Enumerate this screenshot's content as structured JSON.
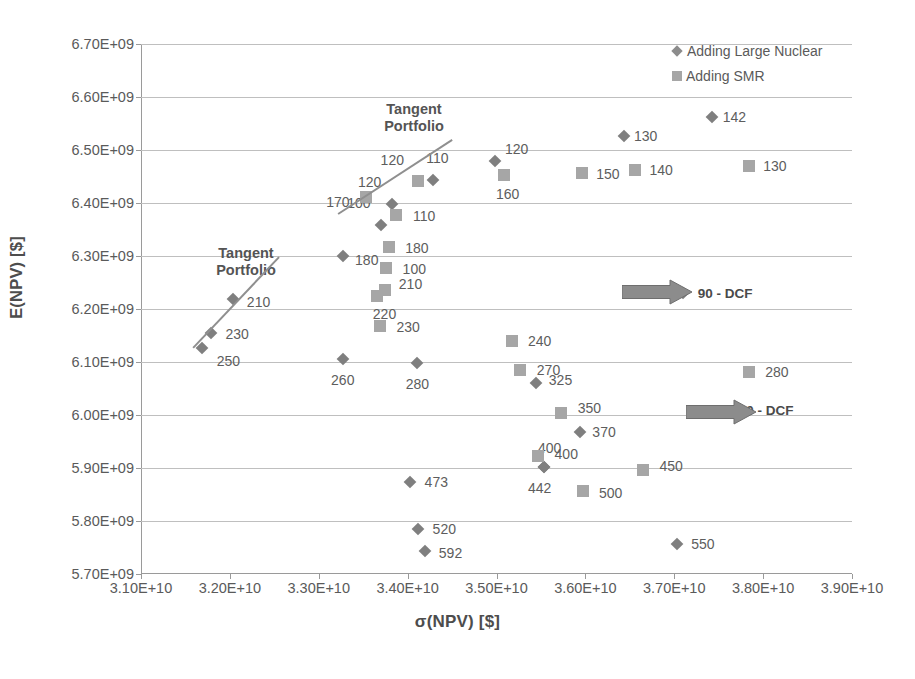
{
  "chart_data": {
    "type": "scatter",
    "title": "",
    "xlabel": "σ(NPV) [$]",
    "ylabel": "E(NPV) [$]",
    "xlim": [
      31000000000,
      39000000000
    ],
    "ylim": [
      5700000000,
      6700000000
    ],
    "xticks": [
      "3.10E+10",
      "3.20E+10",
      "3.30E+10",
      "3.40E+10",
      "3.50E+10",
      "3.60E+10",
      "3.70E+10",
      "3.80E+10",
      "3.90E+10"
    ],
    "yticks": [
      "5.70E+09",
      "5.80E+09",
      "5.90E+09",
      "6.00E+09",
      "6.10E+09",
      "6.20E+09",
      "6.30E+09",
      "6.40E+09",
      "6.50E+09",
      "6.60E+09",
      "6.70E+09"
    ],
    "grid": "horizontal",
    "legend_position": "top-right",
    "colors": {
      "large_nuclear": "#7f7f7f",
      "smr": "#a6a6a6",
      "gridline": "#bfbfbf",
      "text": "#595959"
    },
    "series": [
      {
        "name": "Adding Large Nuclear",
        "marker": "diamond",
        "color": "#7f7f7f",
        "points": [
          {
            "label": "142",
            "x": 37430000000,
            "y": 6563000000,
            "label_dx": 22,
            "label_dy": 0
          },
          {
            "label": "130",
            "x": 36430000000,
            "y": 6527000000,
            "label_dx": 22,
            "label_dy": 0
          },
          {
            "label": "120",
            "x": 34980000000,
            "y": 6479000000,
            "label_dx": 22,
            "label_dy": -12
          },
          {
            "label": "110",
            "x": 34280000000,
            "y": 6443000000,
            "label_dx": 5,
            "label_dy": -22
          },
          {
            "label": "120",
            "x": 33820000000,
            "y": 6399000000,
            "label_dx": -22,
            "label_dy": -22
          },
          {
            "label": "100",
            "x": 33700000000,
            "y": 6359000000,
            "label_dx": -22,
            "label_dy": -22
          },
          {
            "label": "180",
            "x": 33270000000,
            "y": 6300000000,
            "label_dx": 24,
            "label_dy": 4
          },
          {
            "label": "210",
            "x": 32030000000,
            "y": 6219000000,
            "label_dx": 26,
            "label_dy": 3
          },
          {
            "label": "230",
            "x": 31790000000,
            "y": 6155000000,
            "label_dx": 26,
            "label_dy": 1
          },
          {
            "label": "250",
            "x": 31690000000,
            "y": 6127000000,
            "label_dx": 26,
            "label_dy": 13
          },
          {
            "label": "260",
            "x": 33270000000,
            "y": 6106000000,
            "label_dx": 0,
            "label_dy": 21
          },
          {
            "label": "280",
            "x": 34110000000,
            "y": 6098000000,
            "label_dx": 0,
            "label_dy": 21
          },
          {
            "label": "325",
            "x": 35450000000,
            "y": 6060000000,
            "label_dx": 24,
            "label_dy": -3
          },
          {
            "label": "370",
            "x": 35940000000,
            "y": 5968000000,
            "label_dx": 24,
            "label_dy": 0
          },
          {
            "label": "400",
            "x": 35530000000,
            "y": 5902000000,
            "label_dx": 6,
            "label_dy": -19
          },
          {
            "label": "442",
            "x": 35530000000,
            "y": 5902000000,
            "label_dx": -4,
            "label_dy": 21
          },
          {
            "label": "473",
            "x": 34030000000,
            "y": 5873000000,
            "label_dx": 26,
            "label_dy": 0
          },
          {
            "label": "520",
            "x": 34120000000,
            "y": 5784000000,
            "label_dx": 26,
            "label_dy": 0
          },
          {
            "label": "592",
            "x": 34190000000,
            "y": 5744000000,
            "label_dx": 26,
            "label_dy": 2
          },
          {
            "label": "550",
            "x": 37030000000,
            "y": 5756000000,
            "label_dx": 26,
            "label_dy": 0
          },
          {
            "label": "90 - DCF",
            "x": 37100000000,
            "y": 6231000000,
            "label_dx": 42,
            "label_dy": 0,
            "bold": true
          }
        ]
      },
      {
        "name": "Adding SMR",
        "marker": "square",
        "color": "#a6a6a6",
        "points": [
          {
            "label": "130",
            "x": 37840000000,
            "y": 6469000000,
            "label_dx": 26,
            "label_dy": 0
          },
          {
            "label": "140",
            "x": 36560000000,
            "y": 6462000000,
            "label_dx": 26,
            "label_dy": 0
          },
          {
            "label": "150",
            "x": 35960000000,
            "y": 6456000000,
            "label_dx": 26,
            "label_dy": 1
          },
          {
            "label": "160",
            "x": 35080000000,
            "y": 6452000000,
            "label_dx": 4,
            "label_dy": 19
          },
          {
            "label": "120",
            "x": 34120000000,
            "y": 6441000000,
            "label_dx": -26,
            "label_dy": -21
          },
          {
            "label": "110",
            "x": 33870000000,
            "y": 6378000000,
            "label_dx": 28,
            "label_dy": 1
          },
          {
            "label": "180",
            "x": 33790000000,
            "y": 6317000000,
            "label_dx": 28,
            "label_dy": 1
          },
          {
            "label": "100",
            "x": 33760000000,
            "y": 6277000000,
            "label_dx": 28,
            "label_dy": 1
          },
          {
            "label": "210",
            "x": 33740000000,
            "y": 6235000000,
            "label_dx": 26,
            "label_dy": -6
          },
          {
            "label": "220",
            "x": 33650000000,
            "y": 6224000000,
            "label_dx": 8,
            "label_dy": 18
          },
          {
            "label": "230",
            "x": 33690000000,
            "y": 6167000000,
            "label_dx": 28,
            "label_dy": 1
          },
          {
            "label": "240",
            "x": 35170000000,
            "y": 6139000000,
            "label_dx": 28,
            "label_dy": 0
          },
          {
            "label": "270",
            "x": 35270000000,
            "y": 6084000000,
            "label_dx": 28,
            "label_dy": 0
          },
          {
            "label": "350",
            "x": 35730000000,
            "y": 6003000000,
            "label_dx": 28,
            "label_dy": -5
          },
          {
            "label": "400",
            "x": 35470000000,
            "y": 5923000000,
            "label_dx": 28,
            "label_dy": -2
          },
          {
            "label": "450",
            "x": 36650000000,
            "y": 5897000000,
            "label_dx": 28,
            "label_dy": -4
          },
          {
            "label": "500",
            "x": 35970000000,
            "y": 5856000000,
            "label_dx": 28,
            "label_dy": 2
          },
          {
            "label": "280",
            "x": 37840000000,
            "y": 6081000000,
            "label_dx": 28,
            "label_dy": 0
          },
          {
            "label": "170",
            "x": 33530000000,
            "y": 6411000000,
            "label_dx": -28,
            "label_dy": 5
          },
          {
            "label": "90 - DCF",
            "x": 37540000000,
            "y": 6003000000,
            "label_dx": 44,
            "label_dy": -3,
            "bold": true
          }
        ]
      }
    ],
    "annotations": [
      {
        "kind": "tangent-label",
        "text": "Tangent\nPortfolio",
        "x": 246,
        "y": 262
      },
      {
        "kind": "tangent-label",
        "text": "Tangent\nPortfolio",
        "x": 414,
        "y": 118
      },
      {
        "kind": "tangent-line",
        "x1": 193,
        "y1": 347,
        "x2": 279,
        "y2": 256
      },
      {
        "kind": "tangent-line",
        "x1": 338,
        "y1": 213,
        "x2": 452,
        "y2": 139
      },
      {
        "kind": "arrow",
        "x": 622,
        "y": 292,
        "width": 70
      },
      {
        "kind": "arrow",
        "x": 686,
        "y": 412,
        "width": 70
      }
    ]
  },
  "legend": {
    "items": [
      {
        "label": "Adding Large Nuclear",
        "marker": "diamond"
      },
      {
        "label": "Adding SMR",
        "marker": "square"
      }
    ]
  }
}
